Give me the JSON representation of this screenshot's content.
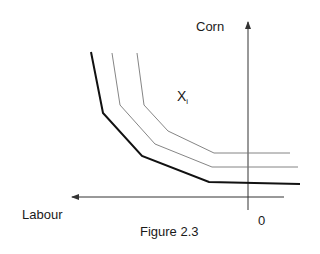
{
  "figure": {
    "caption": "Figure 2.3",
    "y_axis_label": "Corn",
    "x_axis_label": "Labour",
    "origin_label": "0",
    "region_label": "X",
    "region_label_subscript": "i"
  },
  "colors": {
    "background": "#ffffff",
    "axis": "#333333",
    "bold_curve": "#111111",
    "thin_curve": "#777777",
    "text": "#1a1a1a"
  },
  "axes": {
    "vertical": {
      "x": 248,
      "y_top": 22,
      "y_bottom": 210,
      "arrow": "up"
    },
    "horizontal": {
      "y": 197,
      "x_right": 284,
      "x_left": 72,
      "arrow": "left"
    }
  },
  "curves": [
    {
      "name": "outer-isoquant",
      "style": "bold",
      "points": [
        [
          91,
          52
        ],
        [
          103,
          113
        ],
        [
          142,
          156
        ],
        [
          209,
          182
        ],
        [
          300,
          184
        ]
      ]
    },
    {
      "name": "middle-isoquant",
      "style": "thin",
      "points": [
        [
          112,
          53
        ],
        [
          120,
          105
        ],
        [
          155,
          144
        ],
        [
          212,
          167
        ],
        [
          298,
          167
        ]
      ]
    },
    {
      "name": "inner-isoquant",
      "style": "thin",
      "points": [
        [
          137,
          53
        ],
        [
          144,
          105
        ],
        [
          168,
          131
        ],
        [
          214,
          153
        ],
        [
          290,
          153
        ]
      ]
    }
  ]
}
